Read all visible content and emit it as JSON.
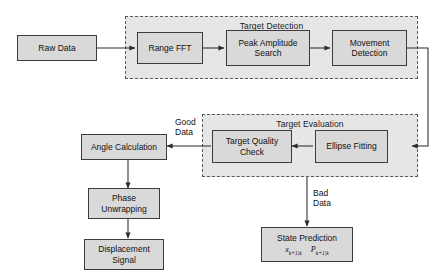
{
  "diagram": {
    "groups": [
      {
        "id": "target_detection",
        "label": "Target Detection"
      },
      {
        "id": "target_evaluation",
        "label": "Target Evaluation"
      }
    ],
    "nodes": [
      {
        "id": "raw_data",
        "line1": "Raw Data",
        "line2": ""
      },
      {
        "id": "range_fft",
        "line1": "Range FFT",
        "line2": ""
      },
      {
        "id": "peak_amplitude",
        "line1": "Peak Amplitude",
        "line2": "Search"
      },
      {
        "id": "movement_detection",
        "line1": "Movement",
        "line2": "Detection"
      },
      {
        "id": "target_quality",
        "line1": "Target Quality",
        "line2": "Check"
      },
      {
        "id": "ellipse_fitting",
        "line1": "Ellipse Fitting",
        "line2": ""
      },
      {
        "id": "angle_calculation",
        "line1": "Angle Calculation",
        "line2": ""
      },
      {
        "id": "phase_unwrapping",
        "line1": "Phase",
        "line2": "Unwrapping"
      },
      {
        "id": "displacement",
        "line1": "Displacement",
        "line2": "Signal"
      },
      {
        "id": "state_prediction",
        "line1": "State Prediction",
        "line2": ""
      }
    ],
    "state_prediction_formula": {
      "x_symbol": "x",
      "x_subscript": "k+1|k",
      "p_symbol": "P",
      "p_subscript": "k+1|k"
    },
    "edge_labels": [
      {
        "id": "good_data",
        "line1": "Good",
        "line2": "Data"
      },
      {
        "id": "bad_data",
        "line1": "Bad",
        "line2": "Data"
      }
    ],
    "colors": {
      "node_fill": "#d9d9d9",
      "node_stroke": "#3c3c3c",
      "group_fill": "#e6e6e6",
      "group_stroke": "#5a5a5a",
      "wire": "#2b2b2b",
      "background": "#ffffff"
    }
  }
}
